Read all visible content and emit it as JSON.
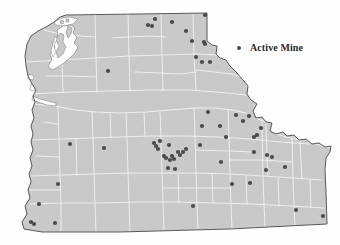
{
  "figure": {
    "region": "Pacific Northwest (Washington, Oregon, Idaho Panhandle)"
  },
  "legend": {
    "position": "top-right",
    "items": [
      {
        "symbol": "filled-circle",
        "label": "Active Mine",
        "color": "#4b4b4b"
      }
    ]
  },
  "colors": {
    "land_fill": "#c9c9c9",
    "county_border": "#f2f2f2",
    "state_outline": "#4a4a4a",
    "water_fill": "#fdfdfd",
    "mine_dot": "#4b4b4b",
    "page_background": "#fefefe"
  },
  "chart_data": {
    "type": "scatter",
    "xlabel": "",
    "ylabel": "",
    "xlim": [
      0,
      340
    ],
    "ylim": [
      0,
      245
    ],
    "grid": false,
    "legend_position": "top-right",
    "series": [
      {
        "name": "Active Mine",
        "color": "#4b4b4b",
        "marker": "o",
        "count": 58,
        "points": [
          [
            155,
            19
          ],
          [
            148,
            25
          ],
          [
            152,
            26
          ],
          [
            172,
            22
          ],
          [
            186,
            31
          ],
          [
            192,
            41
          ],
          [
            205,
            15
          ],
          [
            204,
            42
          ],
          [
            205,
            44
          ],
          [
            202,
            62
          ],
          [
            210,
            62
          ],
          [
            196,
            57
          ],
          [
            108,
            71
          ],
          [
            208,
            112
          ],
          [
            202,
            126
          ],
          [
            220,
            126
          ],
          [
            226,
            137
          ],
          [
            236,
            115
          ],
          [
            243,
            121
          ],
          [
            249,
            116
          ],
          [
            254,
            137
          ],
          [
            257,
            135
          ],
          [
            261,
            128
          ],
          [
            200,
            145
          ],
          [
            221,
            162
          ],
          [
            232,
            184
          ],
          [
            250,
            183
          ],
          [
            254,
            152
          ],
          [
            267,
            155
          ],
          [
            272,
            157
          ],
          [
            266,
            170
          ],
          [
            285,
            167
          ],
          [
            70,
            144
          ],
          [
            104,
            148
          ],
          [
            154,
            143
          ],
          [
            156,
            146
          ],
          [
            158,
            149
          ],
          [
            160,
            141
          ],
          [
            169,
            145
          ],
          [
            164,
            156
          ],
          [
            166,
            158
          ],
          [
            170,
            160
          ],
          [
            172,
            156
          ],
          [
            174,
            159
          ],
          [
            178,
            152
          ],
          [
            180,
            155
          ],
          [
            183,
            152
          ],
          [
            186,
            149
          ],
          [
            168,
            168
          ],
          [
            175,
            169
          ],
          [
            58,
            184
          ],
          [
            39,
            204
          ],
          [
            31,
            222
          ],
          [
            34,
            224
          ],
          [
            55,
            223
          ],
          [
            193,
            206
          ],
          [
            296,
            210
          ],
          [
            323,
            216
          ]
        ]
      }
    ]
  },
  "map": {
    "land_regions": [
      {
        "name": "washington-oregon-idaho-landmass"
      }
    ],
    "features": [
      {
        "name": "puget-sound",
        "type": "water"
      },
      {
        "name": "columbia-river",
        "type": "water"
      },
      {
        "name": "olympic-peninsula",
        "type": "land"
      }
    ]
  }
}
